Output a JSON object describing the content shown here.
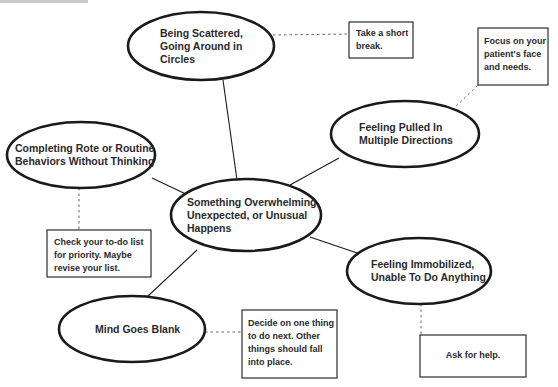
{
  "diagram": {
    "colors": {
      "stroke": "#1a1a1a",
      "text": "#2a2a2a",
      "dotted": "#666666",
      "background": "#ffffff"
    },
    "center": {
      "label": "Something Overwhelming,\nUnexpected, or Unusual\nHappens"
    },
    "situations": [
      {
        "id": "scattered",
        "label": "Being Scattered,\nGoing Around in\nCircles",
        "advice": "Take a short\nbreak."
      },
      {
        "id": "pulled",
        "label": "Feeling Pulled In\nMultiple Directions",
        "advice": "Focus on your\npatient's face\nand needs."
      },
      {
        "id": "rote",
        "label": "Completing Rote or Routine\nBehaviors Without Thinking",
        "advice": "Check your to-do list\nfor priority. Maybe\nrevise your list."
      },
      {
        "id": "immobilized",
        "label": "Feeling Immobilized,\nUnable To Do Anything",
        "advice": "Ask for help."
      },
      {
        "id": "blank",
        "label": "Mind Goes Blank",
        "advice": "Decide on one thing\nto do next. Other\nthings should fall\ninto place."
      }
    ]
  }
}
